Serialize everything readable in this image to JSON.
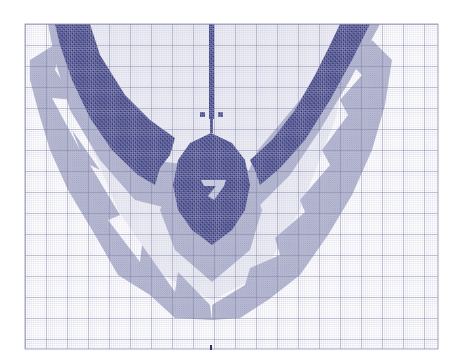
{
  "chart_pattern": {
    "kind": "cross-stitch chart",
    "grid": {
      "left": 25,
      "top": 24,
      "right": 438,
      "bottom": 349,
      "cell_px": 2.1,
      "major_every_cells": 10
    },
    "colors": {
      "background": "#ffffff",
      "minor_grid": "#b9bcd6",
      "major_grid": "#5d5f86",
      "dark_stitch": "#3a3d7c",
      "light_stitch": "#a9acc7",
      "pale_fill": "#d7d9e8"
    },
    "center_marker": {
      "x": 211,
      "y": 349
    },
    "motif": {
      "description": "symmetrical dark wings with a central teardrop pendant, surrounded by a light triangle-scallop border"
    }
  }
}
